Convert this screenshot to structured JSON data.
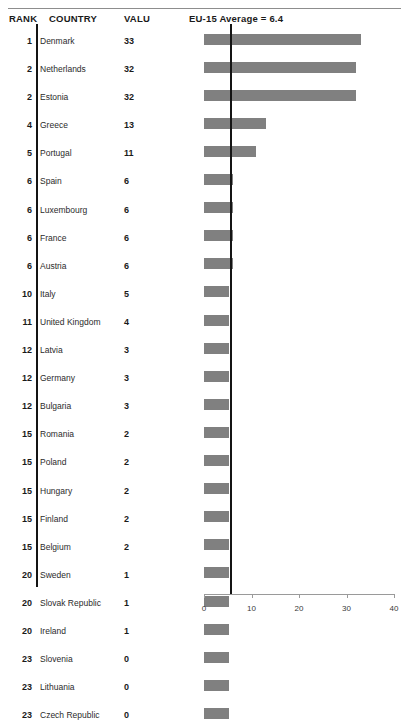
{
  "header": {
    "rank_label": "RANK",
    "country_label": "COUNTRY",
    "value_label": "VALU",
    "note": "EU-15 Average = 6.4"
  },
  "chart_data": {
    "type": "bar",
    "orientation": "horizontal",
    "title": "EU-15 Average = 6.4",
    "xlabel": "",
    "ylabel": "",
    "xlim": [
      0,
      40
    ],
    "xticks": [
      0,
      10,
      20,
      30,
      40
    ],
    "xtick_labels": [
      "0",
      "10",
      "20",
      "30",
      "40"
    ],
    "grid": false,
    "legend": null,
    "reference_line": {
      "label": "EU-15 Average = 6.4",
      "value": 6.4
    },
    "bar_color": "#808080",
    "columns": [
      "RANK",
      "COUNTRY",
      "VALU"
    ],
    "categories": [
      "Denmark",
      "Netherlands",
      "Estonia",
      "Greece",
      "Portugal",
      "Spain",
      "Luxembourg",
      "France",
      "Austria",
      "Italy",
      "United Kingdom",
      "Latvia",
      "Germany",
      "Bulgaria",
      "Romania",
      "Poland",
      "Hungary",
      "Finland",
      "Belgium",
      "Sweden",
      "Slovak Republic",
      "Ireland",
      "Slovenia",
      "Lithuania",
      "Czech Republic"
    ],
    "values": [
      33,
      32,
      32,
      13,
      11,
      6,
      6,
      6,
      6,
      5,
      4,
      3,
      3,
      3,
      2,
      2,
      2,
      2,
      2,
      1,
      1,
      1,
      0,
      0,
      0
    ],
    "ranks": [
      1,
      2,
      2,
      4,
      5,
      6,
      6,
      6,
      6,
      10,
      11,
      12,
      12,
      12,
      15,
      15,
      15,
      15,
      15,
      20,
      20,
      20,
      23,
      23,
      23
    ]
  },
  "rows": [
    {
      "rank": "1",
      "country": "Denmark",
      "value": "33",
      "v": 33
    },
    {
      "rank": "2",
      "country": "Netherlands",
      "value": "32",
      "v": 32
    },
    {
      "rank": "2",
      "country": "Estonia",
      "value": "32",
      "v": 32
    },
    {
      "rank": "4",
      "country": "Greece",
      "value": "13",
      "v": 13
    },
    {
      "rank": "5",
      "country": "Portugal",
      "value": "11",
      "v": 11
    },
    {
      "rank": "6",
      "country": "Spain",
      "value": "6",
      "v": 6
    },
    {
      "rank": "6",
      "country": "Luxembourg",
      "value": "6",
      "v": 6
    },
    {
      "rank": "6",
      "country": "France",
      "value": "6",
      "v": 6
    },
    {
      "rank": "6",
      "country": "Austria",
      "value": "6",
      "v": 6
    },
    {
      "rank": "10",
      "country": "Italy",
      "value": "5",
      "v": 5
    },
    {
      "rank": "11",
      "country": "United Kingdom",
      "value": "4",
      "v": 4
    },
    {
      "rank": "12",
      "country": "Latvia",
      "value": "3",
      "v": 3
    },
    {
      "rank": "12",
      "country": "Germany",
      "value": "3",
      "v": 3
    },
    {
      "rank": "12",
      "country": "Bulgaria",
      "value": "3",
      "v": 3
    },
    {
      "rank": "15",
      "country": "Romania",
      "value": "2",
      "v": 2
    },
    {
      "rank": "15",
      "country": "Poland",
      "value": "2",
      "v": 2
    },
    {
      "rank": "15",
      "country": "Hungary",
      "value": "2",
      "v": 2
    },
    {
      "rank": "15",
      "country": "Finland",
      "value": "2",
      "v": 2
    },
    {
      "rank": "15",
      "country": "Belgium",
      "value": "2",
      "v": 2
    },
    {
      "rank": "20",
      "country": "Sweden",
      "value": "1",
      "v": 1
    },
    {
      "rank": "20",
      "country": "Slovak Republic",
      "value": "1",
      "v": 1
    },
    {
      "rank": "20",
      "country": "Ireland",
      "value": "1",
      "v": 1
    },
    {
      "rank": "23",
      "country": "Slovenia",
      "value": "0",
      "v": 0
    },
    {
      "rank": "23",
      "country": "Lithuania",
      "value": "0",
      "v": 0
    },
    {
      "rank": "23",
      "country": "Czech Republic",
      "value": "0",
      "v": 0
    }
  ]
}
